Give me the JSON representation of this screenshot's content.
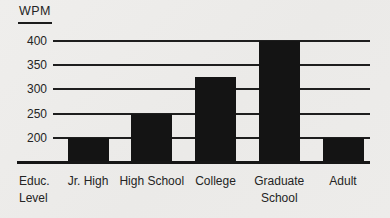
{
  "chart_data": {
    "type": "bar",
    "title": "",
    "ylabel": "WPM",
    "xlabel": "Educ. Level",
    "categories": [
      "Jr. High",
      "High School",
      "College",
      "Graduate School",
      "Adult"
    ],
    "values": [
      200,
      250,
      325,
      400,
      200
    ],
    "yticks": [
      200,
      250,
      300,
      350,
      400
    ],
    "ylim": [
      150,
      420
    ],
    "grid": "horizontal",
    "legend": "none",
    "bar_color": "#141414",
    "line_color": "#1e1e1e",
    "background_color": "#edecea"
  }
}
